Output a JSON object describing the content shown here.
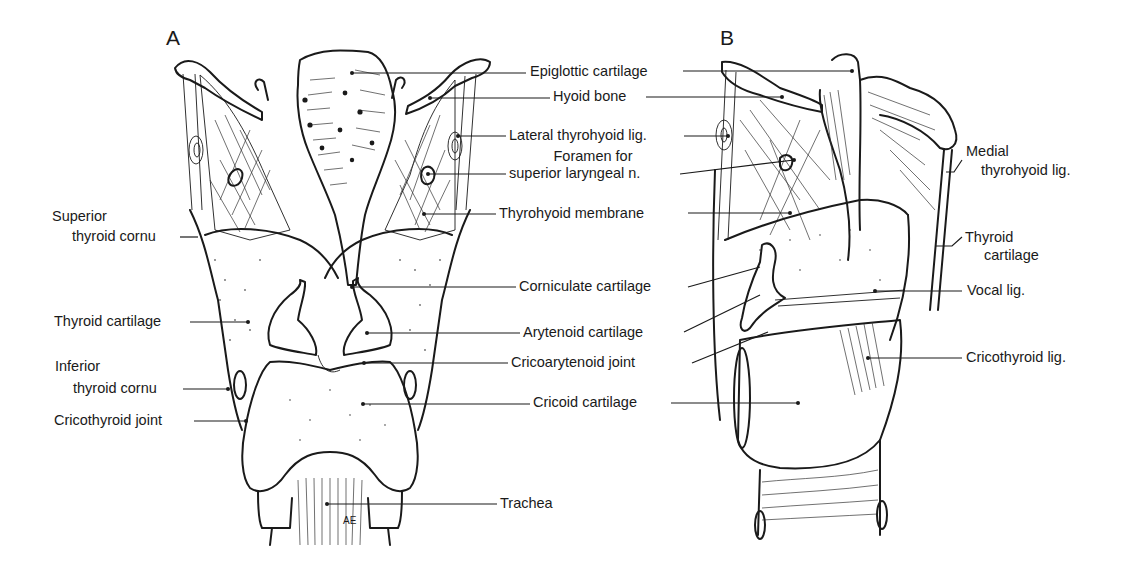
{
  "figure": {
    "panels": [
      {
        "id": "A",
        "letter": "A",
        "view": "posterior"
      },
      {
        "id": "B",
        "letter": "B",
        "view": "lateral-sagittal"
      }
    ],
    "initials": "AE"
  },
  "labels": {
    "center": {
      "epiglottic_cartilage": "Epiglottic cartilage",
      "hyoid_bone": "Hyoid bone",
      "lateral_thyrohyoid_lig": "Lateral thyrohyoid lig.",
      "foramen_line1": "Foramen for",
      "foramen_line2": "superior laryngeal n.",
      "thyrohyoid_membrane": "Thyrohyoid membrane",
      "corniculate_cartilage": "Corniculate cartilage",
      "arytenoid_cartilage": "Arytenoid cartilage",
      "cricoarytenoid_joint": "Cricoarytenoid joint",
      "cricoid_cartilage": "Cricoid cartilage",
      "trachea": "Trachea"
    },
    "left": {
      "superior_line1": "Superior",
      "superior_line2": "thyroid cornu",
      "thyroid_cartilage": "Thyroid cartilage",
      "inferior_line1": "Inferior",
      "inferior_line2": "thyroid cornu",
      "cricothyroid_joint": "Cricothyroid joint"
    },
    "right": {
      "medial_line1": "Medial",
      "medial_line2": "thyrohyoid lig.",
      "thyroid_line1": "Thyroid",
      "thyroid_line2": "cartilage",
      "vocal_lig": "Vocal lig.",
      "cricothyroid_lig": "Cricothyroid lig."
    }
  }
}
